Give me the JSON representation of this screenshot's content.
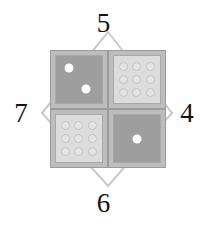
{
  "canvas": {
    "width": 207,
    "height": 228,
    "background": "#ffffff"
  },
  "diagram": {
    "type": "dice-diamond-puzzle",
    "diamond": {
      "stroke_color": "#c9c9c9",
      "stroke_width": 2,
      "vertices": {
        "top": {
          "x": 108,
          "y": 32
        },
        "right": {
          "x": 172,
          "y": 113
        },
        "bottom": {
          "x": 108,
          "y": 186
        },
        "left": {
          "x": 42,
          "y": 113
        }
      }
    },
    "edge_numbers": {
      "top": "5",
      "right": "4",
      "bottom": "6",
      "left": "7",
      "color": "#121212"
    },
    "dice": [
      {
        "position": "top-left",
        "face_style": "dark",
        "face_color": "#9e9e9e",
        "pip_color": "#fcfcfc",
        "pip_count": 2,
        "pip_layout": "diagonal",
        "pips": [
          {
            "x": 28,
            "y": 26
          },
          {
            "x": 66,
            "y": 70
          }
        ]
      },
      {
        "position": "top-right",
        "face_style": "light",
        "face_color": "#dcdcdc",
        "pip_color": "#e4e4e4",
        "pip_count": 9,
        "pip_layout": "grid-3x3"
      },
      {
        "position": "bottom-left",
        "face_style": "light",
        "face_color": "#dcdcdc",
        "pip_color": "#e4e4e4",
        "pip_count": 9,
        "pip_layout": "grid-3x3"
      },
      {
        "position": "bottom-right",
        "face_style": "dark",
        "face_color": "#9e9e9e",
        "pip_color": "#fcfcfc",
        "pip_count": 1,
        "pip_layout": "center",
        "pips": [
          {
            "x": 50,
            "y": 50
          }
        ]
      }
    ],
    "colors": {
      "die_border": "#9b9b9b",
      "die_frame": "#bdbdbd",
      "face_inner_border": "#a8a8a8"
    }
  }
}
